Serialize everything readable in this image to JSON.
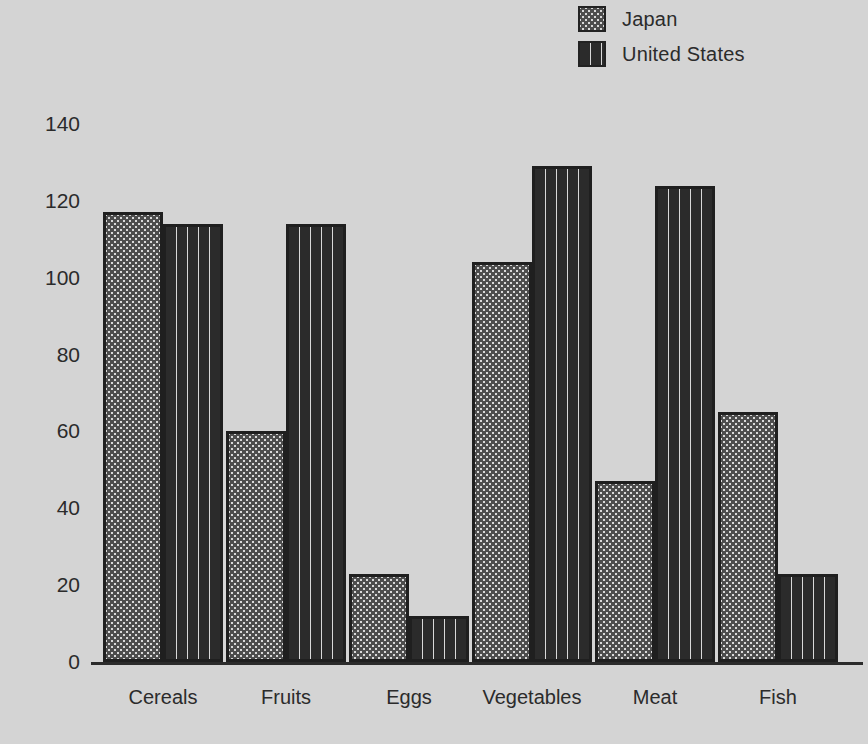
{
  "chart_data": {
    "type": "bar",
    "title": "",
    "subtitle": "",
    "xlabel": "",
    "ylabel": "",
    "categories": [
      "Cereals",
      "Fruits",
      "Eggs",
      "Vegetables",
      "Meat",
      "Fish"
    ],
    "series": [
      {
        "name": "Japan",
        "values": [
          117,
          60,
          23,
          104,
          47,
          65
        ]
      },
      {
        "name": "United States",
        "values": [
          114,
          114,
          12,
          129,
          124,
          23
        ]
      }
    ],
    "ylim": [
      0,
      140
    ],
    "ytick_labels": [
      "0",
      "20",
      "40",
      "60",
      "80",
      "100",
      "120",
      "140"
    ],
    "ytick_values": [
      0,
      20,
      40,
      60,
      80,
      100,
      120,
      140
    ],
    "grid": false,
    "legend_position": "top-right",
    "legend": [
      {
        "label": "Japan",
        "swatch": "dark-dotted-pattern"
      },
      {
        "label": "United States",
        "swatch": "light-dashed-pattern"
      }
    ],
    "colors": {
      "background": "#d4d4d4",
      "text": "#2b2b2b",
      "japan_fill": "#4d4d4d",
      "japan_dots": "#d9d9d9",
      "united_states_fill": "#d9d9d9",
      "united_states_dashes": "#2b2b2b",
      "bar_outline": "#1f1f1f",
      "axis": "#2b2b2b"
    }
  }
}
